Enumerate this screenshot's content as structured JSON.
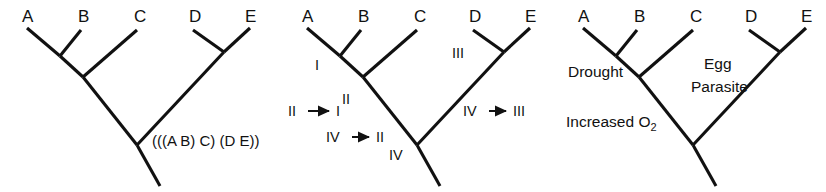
{
  "figure": {
    "background_color": "#ffffff",
    "line_color": "#111111",
    "panel_count": 3
  },
  "taxa": [
    "A",
    "B",
    "C",
    "D",
    "E"
  ],
  "topology_description": "(((A B) C) (D E))",
  "panels": [
    {
      "id": "left",
      "name": "topology-panel",
      "tips": [
        {
          "label": "A",
          "x": 22,
          "y": 22
        },
        {
          "label": "B",
          "x": 78,
          "y": 22
        },
        {
          "label": "C",
          "x": 134,
          "y": 22
        },
        {
          "label": "D",
          "x": 189,
          "y": 22
        },
        {
          "label": "E",
          "x": 245,
          "y": 22
        }
      ],
      "annotations": [
        {
          "text": "(((A B) C) (D E))",
          "x": 155,
          "y": 146
        }
      ]
    },
    {
      "id": "middle",
      "name": "character-state-panel",
      "tips": [
        {
          "label": "A",
          "x": 22,
          "y": 22
        },
        {
          "label": "B",
          "x": 78,
          "y": 22
        },
        {
          "label": "C",
          "x": 134,
          "y": 22
        },
        {
          "label": "D",
          "x": 189,
          "y": 22
        },
        {
          "label": "E",
          "x": 245,
          "y": 22
        }
      ],
      "node_states": [
        {
          "text": "I",
          "x": 35,
          "y": 70
        },
        {
          "text": "II",
          "x": 62,
          "y": 104
        },
        {
          "text": "IV",
          "x": 109,
          "y": 160
        },
        {
          "text": "III",
          "x": 172,
          "y": 58
        }
      ],
      "transitions": [
        {
          "from": "II",
          "to": "I",
          "x": 8,
          "y": 116,
          "arrow_x": 26,
          "arrow_w": 28
        },
        {
          "from": "IV",
          "to": "II",
          "x": 46,
          "y": 142,
          "arrow_x": 70,
          "arrow_w": 26
        },
        {
          "from": "IV",
          "to": "III",
          "x": 185,
          "y": 116,
          "arrow_x": 209,
          "arrow_w": 26
        }
      ]
    },
    {
      "id": "right",
      "name": "selective-pressure-panel",
      "tips": [
        {
          "label": "A",
          "x": 22,
          "y": 22
        },
        {
          "label": "B",
          "x": 78,
          "y": 22
        },
        {
          "label": "C",
          "x": 134,
          "y": 22
        },
        {
          "label": "D",
          "x": 189,
          "y": 22
        },
        {
          "label": "E",
          "x": 245,
          "y": 22
        }
      ],
      "traits": [
        {
          "text": "Drought",
          "x": 16,
          "y": 77,
          "has_subscript": false
        },
        {
          "text": "Egg",
          "x": 148,
          "y": 69,
          "has_subscript": false
        },
        {
          "text": "Parasite",
          "x": 135,
          "y": 92,
          "has_subscript": false
        },
        {
          "text": "Increased O",
          "subscript": "2",
          "x": 12,
          "y": 127,
          "has_subscript": true
        }
      ]
    }
  ]
}
